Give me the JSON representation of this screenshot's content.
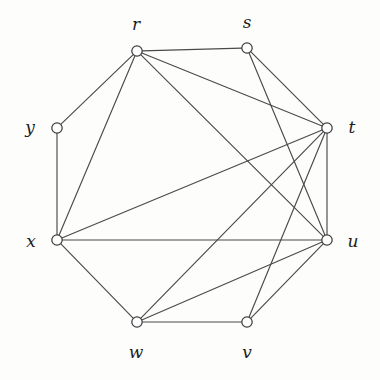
{
  "figure": {
    "kind": "undirected-graph-diagram",
    "background_color": "#fdfdfc",
    "edge_color": "#4a4a4a",
    "vertex_fill_color": "#ffffff",
    "vertex_stroke_color": "#3d3d3d",
    "label_color": "#1d1d1d",
    "vertex_radius": 5.2,
    "vertex_count": 8,
    "edge_count": 16
  },
  "vertices": [
    {
      "id": "r",
      "label": "r",
      "cx": 137,
      "cy": 51,
      "label_x": 136,
      "label_y": 24,
      "degree": 5
    },
    {
      "id": "s",
      "label": "s",
      "cx": 247,
      "cy": 48,
      "label_x": 247,
      "label_y": 22,
      "degree": 4
    },
    {
      "id": "t",
      "label": "t",
      "cx": 327,
      "cy": 128,
      "label_x": 352,
      "label_y": 127,
      "degree": 7
    },
    {
      "id": "u",
      "label": "u",
      "cx": 327,
      "cy": 240,
      "label_x": 353,
      "label_y": 241,
      "degree": 7
    },
    {
      "id": "v",
      "label": "v",
      "cx": 247,
      "cy": 322,
      "label_x": 247,
      "label_y": 352,
      "degree": 3
    },
    {
      "id": "w",
      "label": "w",
      "cx": 137,
      "cy": 322,
      "label_x": 136,
      "label_y": 352,
      "degree": 4
    },
    {
      "id": "x",
      "label": "x",
      "cx": 57,
      "cy": 240,
      "label_x": 31,
      "label_y": 241,
      "degree": 5
    },
    {
      "id": "y",
      "label": "y",
      "cx": 57,
      "cy": 128,
      "label_x": 30,
      "label_y": 127,
      "degree": 2
    }
  ],
  "edges": [
    {
      "from": "r",
      "to": "s",
      "kind": "cycle"
    },
    {
      "from": "s",
      "to": "t",
      "kind": "cycle"
    },
    {
      "from": "t",
      "to": "u",
      "kind": "cycle"
    },
    {
      "from": "u",
      "to": "v",
      "kind": "cycle"
    },
    {
      "from": "v",
      "to": "w",
      "kind": "cycle"
    },
    {
      "from": "w",
      "to": "x",
      "kind": "cycle"
    },
    {
      "from": "x",
      "to": "y",
      "kind": "cycle"
    },
    {
      "from": "y",
      "to": "r",
      "kind": "cycle"
    },
    {
      "from": "r",
      "to": "x",
      "kind": "chord"
    },
    {
      "from": "r",
      "to": "t",
      "kind": "chord"
    },
    {
      "from": "r",
      "to": "u",
      "kind": "chord"
    },
    {
      "from": "s",
      "to": "u",
      "kind": "chord"
    },
    {
      "from": "x",
      "to": "t",
      "kind": "chord"
    },
    {
      "from": "x",
      "to": "u",
      "kind": "chord"
    },
    {
      "from": "w",
      "to": "t",
      "kind": "chord"
    },
    {
      "from": "w",
      "to": "u",
      "kind": "chord"
    },
    {
      "from": "v",
      "to": "t",
      "kind": "chord"
    }
  ]
}
